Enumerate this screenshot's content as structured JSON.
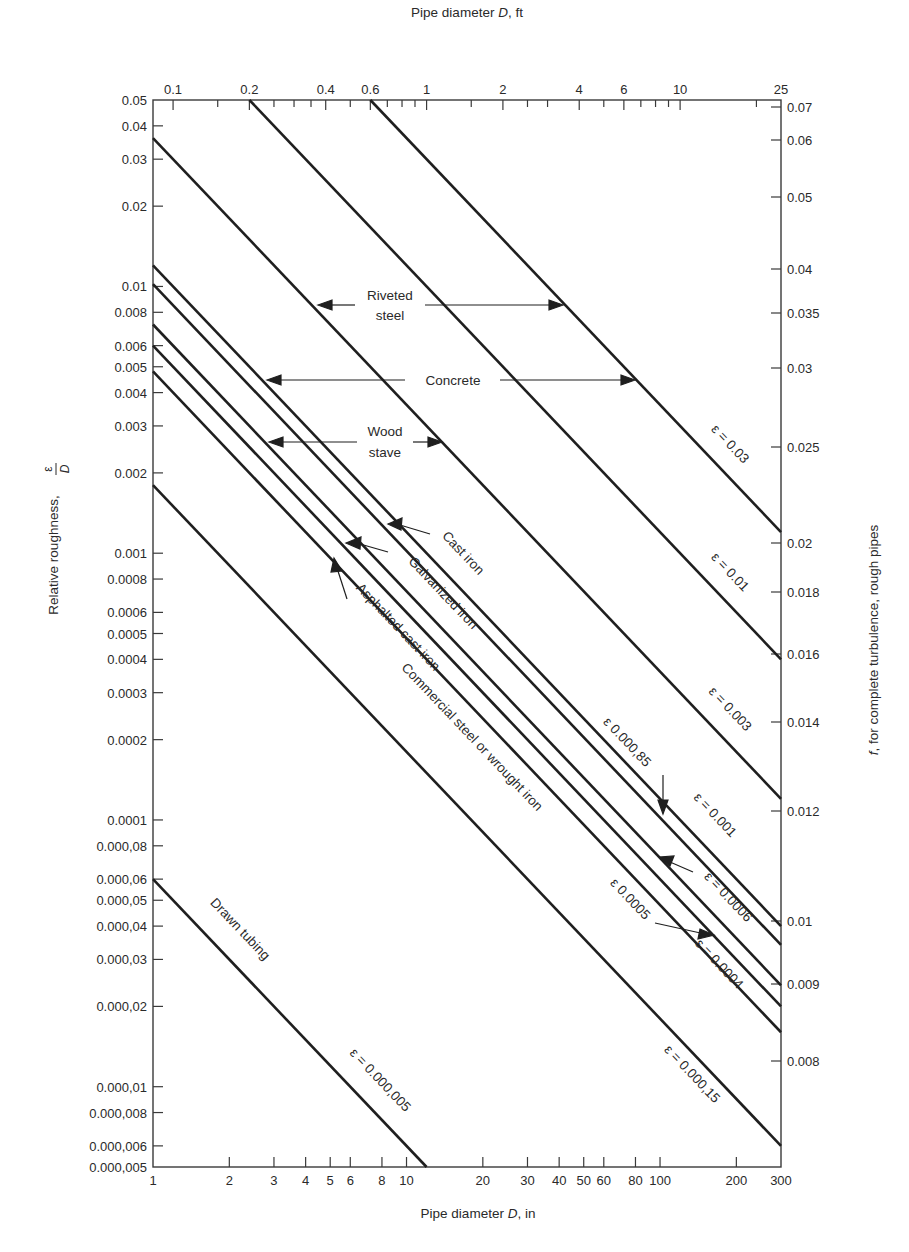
{
  "chart_data": {
    "type": "line",
    "title": "",
    "xlabel": "Pipe diameter D, in",
    "x2label": "Pipe diameter D, ft",
    "ylabel": "Relative roughness, ε/D",
    "y2label": "f, for complete turbulence, rough pipes",
    "xscale": "log",
    "yscale": "log",
    "xlim": [
      1,
      300
    ],
    "ylim": [
      5e-06,
      0.05
    ],
    "grid": false,
    "x_ticks": [
      {
        "v": 1,
        "label": "1"
      },
      {
        "v": 2,
        "label": "2"
      },
      {
        "v": 3,
        "label": "3"
      },
      {
        "v": 4,
        "label": "4"
      },
      {
        "v": 5,
        "label": "5"
      },
      {
        "v": 6,
        "label": "6"
      },
      {
        "v": 8,
        "label": "8"
      },
      {
        "v": 10,
        "label": "10"
      },
      {
        "v": 20,
        "label": "20"
      },
      {
        "v": 30,
        "label": "30"
      },
      {
        "v": 40,
        "label": "40"
      },
      {
        "v": 50,
        "label": "50"
      },
      {
        "v": 60,
        "label": "60"
      },
      {
        "v": 80,
        "label": "80"
      },
      {
        "v": 100,
        "label": "100"
      },
      {
        "v": 200,
        "label": "200"
      },
      {
        "v": 300,
        "label": "300"
      }
    ],
    "x2_ticks_ft": [
      {
        "v": 0.1,
        "label": "0.1"
      },
      {
        "v": 0.15,
        "label": ""
      },
      {
        "v": 0.2,
        "label": "0.2"
      },
      {
        "v": 0.25,
        "label": ""
      },
      {
        "v": 0.3,
        "label": ""
      },
      {
        "v": 0.35,
        "label": ""
      },
      {
        "v": 0.4,
        "label": "0.4"
      },
      {
        "v": 0.5,
        "label": ""
      },
      {
        "v": 0.6,
        "label": "0.6"
      },
      {
        "v": 0.7,
        "label": ""
      },
      {
        "v": 0.8,
        "label": ""
      },
      {
        "v": 0.9,
        "label": ""
      },
      {
        "v": 1,
        "label": "1"
      },
      {
        "v": 1.5,
        "label": ""
      },
      {
        "v": 2,
        "label": "2"
      },
      {
        "v": 2.5,
        "label": ""
      },
      {
        "v": 3,
        "label": ""
      },
      {
        "v": 4,
        "label": "4"
      },
      {
        "v": 5,
        "label": ""
      },
      {
        "v": 6,
        "label": "6"
      },
      {
        "v": 7,
        "label": ""
      },
      {
        "v": 8,
        "label": ""
      },
      {
        "v": 9,
        "label": ""
      },
      {
        "v": 10,
        "label": "10"
      },
      {
        "v": 20,
        "label": ""
      },
      {
        "v": 25,
        "label": "25"
      }
    ],
    "y_ticks": [
      {
        "v": 0.05,
        "label": "0.05"
      },
      {
        "v": 0.04,
        "label": "0.04"
      },
      {
        "v": 0.03,
        "label": "0.03"
      },
      {
        "v": 0.02,
        "label": "0.02"
      },
      {
        "v": 0.01,
        "label": "0.01"
      },
      {
        "v": 0.008,
        "label": "0.008"
      },
      {
        "v": 0.006,
        "label": "0.006"
      },
      {
        "v": 0.005,
        "label": "0.005"
      },
      {
        "v": 0.004,
        "label": "0.004"
      },
      {
        "v": 0.003,
        "label": "0.003"
      },
      {
        "v": 0.002,
        "label": "0.002"
      },
      {
        "v": 0.001,
        "label": "0.001"
      },
      {
        "v": 0.0008,
        "label": "0.0008"
      },
      {
        "v": 0.0006,
        "label": "0.0006"
      },
      {
        "v": 0.0005,
        "label": "0.0005"
      },
      {
        "v": 0.0004,
        "label": "0.0004"
      },
      {
        "v": 0.0003,
        "label": "0.0003"
      },
      {
        "v": 0.0002,
        "label": "0.0002"
      },
      {
        "v": 0.0001,
        "label": "0.0001"
      },
      {
        "v": 8e-05,
        "label": "0.000,08"
      },
      {
        "v": 6e-05,
        "label": "0.000,06"
      },
      {
        "v": 5e-05,
        "label": "0.000,05"
      },
      {
        "v": 4e-05,
        "label": "0.000,04"
      },
      {
        "v": 3e-05,
        "label": "0.000,03"
      },
      {
        "v": 2e-05,
        "label": "0.000,02"
      },
      {
        "v": 1e-05,
        "label": "0.000,01"
      },
      {
        "v": 8e-06,
        "label": "0.000,008"
      },
      {
        "v": 6e-06,
        "label": "0.000,006"
      },
      {
        "v": 5e-06,
        "label": "0.000,005"
      }
    ],
    "y2_ticks_f": [
      {
        "y_px": 107,
        "label": "0.07"
      },
      {
        "y_px": 140,
        "label": "0.06"
      },
      {
        "y_px": 197,
        "label": "0.05"
      },
      {
        "y_px": 269,
        "label": "0.04"
      },
      {
        "y_px": 313,
        "label": "0.035"
      },
      {
        "y_px": 368,
        "label": "0.03"
      },
      {
        "y_px": 447,
        "label": "0.025"
      },
      {
        "y_px": 543,
        "label": "0.02"
      },
      {
        "y_px": 592,
        "label": "0.018"
      },
      {
        "y_px": 654,
        "label": "0.016"
      },
      {
        "y_px": 722,
        "label": "0.014"
      },
      {
        "y_px": 811,
        "label": "0.012"
      },
      {
        "y_px": 921,
        "label": "0.01"
      },
      {
        "y_px": 984,
        "label": "0.009"
      },
      {
        "y_px": 1061,
        "label": "0.008"
      }
    ],
    "series": [
      {
        "name": "Riveted steel (upper)",
        "epsilon_ft": 0.03,
        "label": "ε = 0.03",
        "x": [
          7.2,
          300
        ],
        "y": [
          0.05,
          0.0012
        ]
      },
      {
        "name": "Riveted steel / Concrete",
        "epsilon_ft": 0.01,
        "label": "ε = 0.01",
        "x": [
          2.4,
          300
        ],
        "y": [
          0.05,
          0.0004
        ]
      },
      {
        "name": "Concrete / Wood stave",
        "epsilon_ft": 0.003,
        "label": "ε = 0.003",
        "x": [
          1,
          300
        ],
        "y": [
          0.036,
          0.00012
        ]
      },
      {
        "name": "Wood stave / Concrete",
        "epsilon_ft": 0.001,
        "label": "ε = 0.001",
        "x": [
          1,
          300
        ],
        "y": [
          0.012,
          4e-05
        ]
      },
      {
        "name": "Cast iron",
        "epsilon_ft": 0.00085,
        "label": "ε 0.000,85",
        "x": [
          1,
          300
        ],
        "y": [
          0.0102,
          3.4e-05
        ]
      },
      {
        "name": "Galvanized iron",
        "epsilon_ft": 0.0005,
        "label": "ε 0.0005",
        "x": [
          1,
          300
        ],
        "y": [
          0.006,
          2e-05
        ]
      },
      {
        "name": "Asphalted cast iron",
        "epsilon_ft": 0.0004,
        "label": "ε = 0.0004",
        "x": [
          1,
          300
        ],
        "y": [
          0.0048,
          1.6e-05
        ]
      },
      {
        "name": "Wood stave (lower)",
        "epsilon_ft": 0.0006,
        "label": "ε = 0.0006",
        "x": [
          1,
          300
        ],
        "y": [
          0.0072,
          2.4e-05
        ]
      },
      {
        "name": "Commercial steel or wrought iron",
        "epsilon_ft": 0.00015,
        "label": "ε = 0.000,15",
        "x": [
          1,
          300
        ],
        "y": [
          0.0018,
          6e-06
        ]
      },
      {
        "name": "Drawn tubing",
        "epsilon_ft": 5e-06,
        "label": "ε = 0.000,005",
        "x": [
          1,
          12
        ],
        "y": [
          6e-05,
          5e-06
        ]
      }
    ],
    "annotations": {
      "riveted": {
        "line1": "Riveted",
        "line2": "steel"
      },
      "concrete": "Concrete",
      "wood": {
        "line1": "Wood",
        "line2": "stave"
      },
      "cast_iron": "Cast iron",
      "galvanized": "Galvanized iron",
      "asphalted": "Asphalted cast iron",
      "commercial": "Commercial steel or wrought iron",
      "drawn": "Drawn tubing",
      "eps_003": "ε = 0.03",
      "eps_001": "ε = 0.01",
      "eps_0003": "ε = 0.003",
      "eps_000085": "ε 0.000,85",
      "eps_0001": "ε = 0.001",
      "eps_00006": "ε = 0.0006",
      "eps_00005": "ε 0.0005",
      "eps_00004": "ε = 0.0004",
      "eps_000015": "ε = 0.000,15",
      "eps_0000005": "ε = 0.000,005"
    }
  },
  "axes": {
    "top_title_pre": "Pipe diameter ",
    "top_title_var": "D",
    "top_title_post": ", ft",
    "bottom_title_pre": "Pipe diameter  ",
    "bottom_title_var": "D",
    "bottom_title_post": ", in",
    "left_title": "Relative roughness,",
    "left_frac_num": "ε",
    "left_frac_den": "D",
    "right_title_var": "f",
    "right_title_post": ", for complete turbulence, rough pipes"
  },
  "colors": {
    "line": "#1f1f1f",
    "axis": "#3a3a3a",
    "text": "#2a2a2a",
    "background": "#ffffff"
  }
}
